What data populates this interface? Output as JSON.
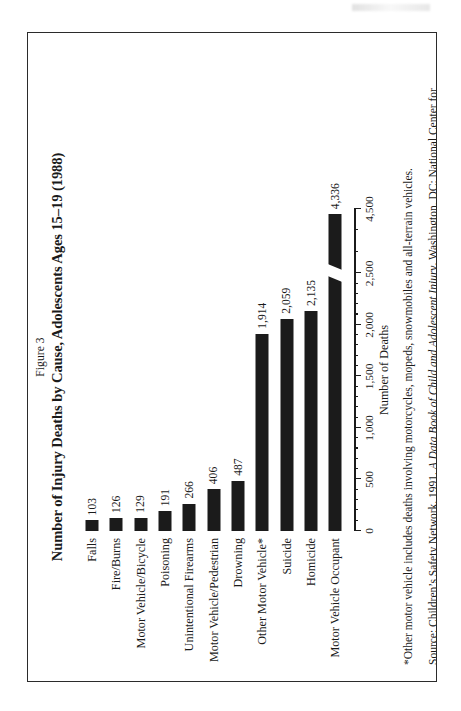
{
  "figure": {
    "number": "Figure 3",
    "title": "Number of Injury Deaths by Cause, Adolescents Ages 15–19 (1988)"
  },
  "notes": {
    "footnote": "*Other motor vehicle includes deaths involving motorcycles, mopeds, snowmobiles and all-terrain vehicles.",
    "source_prefix": "Source: Children’s Safety Network. 1991. ",
    "source_italic": "A Data Book of Child and Adolescent Injury",
    "source_suffix": ". Washington, DC: National Center for Education in Maternal and Child Health."
  },
  "chart_data": {
    "type": "bar",
    "orientation": "horizontal",
    "title": "Number of Injury Deaths by Cause, Adolescents Ages 15–19 (1988)",
    "xlabel": "Number of Deaths",
    "ylabel": "",
    "xlim": [
      0,
      4500
    ],
    "grid": false,
    "legend": "none",
    "axis_break": {
      "present": true,
      "between": [
        2500,
        4500
      ],
      "applies_to": "Motor Vehicle Occupant"
    },
    "tick_labels": [
      "0",
      "500",
      "1,000",
      "1,500",
      "2,000",
      "2,500",
      "4,500"
    ],
    "tick_values": [
      0,
      500,
      1000,
      1500,
      2000,
      2500,
      4500
    ],
    "minor_tick_interval": 100,
    "categories": [
      "Falls",
      "Fire/Burns",
      "Motor Vehicle/Bicycle",
      "Poisoning",
      "Unintentional Firearms",
      "Motor Vehicle/Pedestrian",
      "Drowning",
      "Other Motor Vehicle*",
      "Suicide",
      "Homicide",
      "Motor Vehicle Occupant"
    ],
    "values": [
      103,
      126,
      129,
      191,
      266,
      406,
      487,
      1914,
      2059,
      2135,
      4336
    ],
    "value_labels": [
      "103",
      "126",
      "129",
      "191",
      "266",
      "406",
      "487",
      "1,914",
      "2,059",
      "2,135",
      "4,336"
    ],
    "bar_color": "#1b1b1b"
  }
}
